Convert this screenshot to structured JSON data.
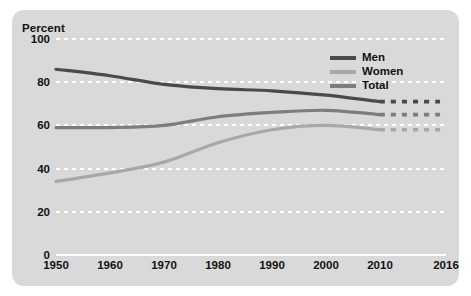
{
  "chart_data": {
    "type": "line",
    "title": "",
    "subtitle": "",
    "xlabel": "",
    "ylabel": "Percent",
    "xlim": [
      1950,
      2016
    ],
    "ylim": [
      0,
      100
    ],
    "grid": true,
    "legend_position": "top-right",
    "y_ticks": [
      100,
      80,
      60,
      40,
      20,
      0
    ],
    "y_tick_labels": [
      "100",
      "80",
      "60",
      "40",
      "20",
      "0"
    ],
    "x_ticks": [
      1950,
      1960,
      1970,
      1980,
      1990,
      2000,
      2010,
      2016
    ],
    "x_tick_labels": [
      "1950",
      "1960",
      "1970",
      "1980",
      "1990",
      "2000",
      "2010",
      "2016"
    ],
    "projection_note": "Dashed segments from 2010 to 2016 indicate projected values",
    "x": [
      1950,
      1960,
      1970,
      1980,
      1990,
      2000,
      2010,
      2016
    ],
    "series": [
      {
        "name": "Men",
        "color": "#4a4a4a",
        "values": [
          86,
          83,
          79,
          77,
          76,
          74,
          71,
          71
        ],
        "solid_until": 2010,
        "dashed_from": 2010
      },
      {
        "name": "Women",
        "color": "#a8a8a8",
        "values": [
          34,
          38,
          43,
          52,
          58,
          60,
          58,
          58
        ],
        "solid_until": 2010,
        "dashed_from": 2010
      },
      {
        "name": "Total",
        "color": "#7d7d7d",
        "values": [
          59,
          59,
          60,
          64,
          66,
          67,
          65,
          65
        ],
        "solid_until": 2010,
        "dashed_from": 2010
      }
    ]
  },
  "axis": {
    "y_label": "Percent"
  },
  "legend": {
    "items": [
      {
        "label": "Men",
        "color": "#4a4a4a"
      },
      {
        "label": "Women",
        "color": "#a8a8a8"
      },
      {
        "label": "Total",
        "color": "#7d7d7d"
      }
    ]
  },
  "colors": {
    "panel_background": "#d9d9d9",
    "gridline": "#ffffff",
    "text": "#111111",
    "men": "#4a4a4a",
    "women": "#a8a8a8",
    "total": "#7d7d7d"
  }
}
